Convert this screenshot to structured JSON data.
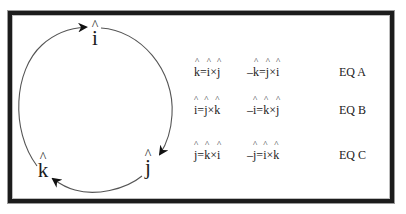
{
  "diagram": {
    "cycle": {
      "nodes": [
        {
          "id": "i",
          "label": "i",
          "hat": "^"
        },
        {
          "id": "j",
          "label": "j",
          "hat": "^"
        },
        {
          "id": "k",
          "label": "k",
          "hat": "^"
        }
      ],
      "direction": "clockwise",
      "edges": [
        {
          "from": "k",
          "to": "i"
        },
        {
          "from": "i",
          "to": "j"
        },
        {
          "from": "j",
          "to": "k"
        }
      ],
      "stroke_color": "#555555",
      "arrow_color": "#111111"
    },
    "equations": [
      {
        "positive": {
          "lhs_sign": "",
          "lhs": "k",
          "op1": "i",
          "op2": "j"
        },
        "negative": {
          "lhs_sign": "–",
          "lhs": "k",
          "op1": "j",
          "op2": "i"
        },
        "label": "EQ A"
      },
      {
        "positive": {
          "lhs_sign": "",
          "lhs": "i",
          "op1": "j",
          "op2": "k"
        },
        "negative": {
          "lhs_sign": "–",
          "lhs": "i",
          "op1": "k",
          "op2": "j"
        },
        "label": "EQ B"
      },
      {
        "positive": {
          "lhs_sign": "",
          "lhs": "j",
          "op1": "k",
          "op2": "i"
        },
        "negative": {
          "lhs_sign": "–",
          "lhs": "j",
          "op1": "i",
          "op2": "k"
        },
        "label": "EQ C"
      }
    ],
    "symbols": {
      "equals": "=",
      "cross": "×",
      "hat": "^"
    },
    "colors": {
      "frame": "#1c1c1c",
      "background": "#ffffff",
      "text": "#1a1a1a"
    }
  }
}
